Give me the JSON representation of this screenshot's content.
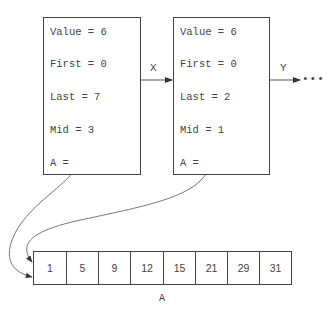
{
  "frames": [
    {
      "fields": [
        "Value = 6",
        "First = 0",
        "Last = 7",
        "Mid = 3",
        "A ="
      ]
    },
    {
      "fields": [
        "Value = 6",
        "First = 0",
        "Last = 2",
        "Mid = 1",
        "A ="
      ]
    }
  ],
  "edges": {
    "x_label": "X",
    "y_label": "Y",
    "continuation": "•••"
  },
  "array": {
    "label": "A",
    "values": [
      "1",
      "5",
      "9",
      "12",
      "15",
      "21",
      "29",
      "31"
    ]
  }
}
